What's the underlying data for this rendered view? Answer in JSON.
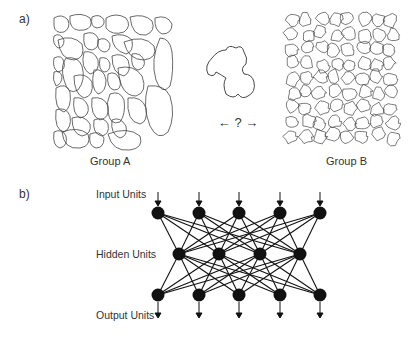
{
  "panel_a": {
    "label": "a)",
    "group_a_caption": "Group A",
    "group_b_caption": "Group B",
    "query_symbol": "← ? →"
  },
  "panel_b": {
    "label": "b)",
    "layers": [
      {
        "name": "Input Units",
        "count": 5,
        "y": 213,
        "xs": [
          158,
          199,
          239,
          280,
          320
        ]
      },
      {
        "name": "Hidden Units",
        "count": 4,
        "y": 254,
        "xs": [
          179,
          219,
          260,
          300
        ]
      },
      {
        "name": "Output Units",
        "count": 5,
        "y": 295,
        "xs": [
          158,
          199,
          239,
          280,
          320
        ]
      }
    ],
    "connectivity": "fully-connected"
  }
}
